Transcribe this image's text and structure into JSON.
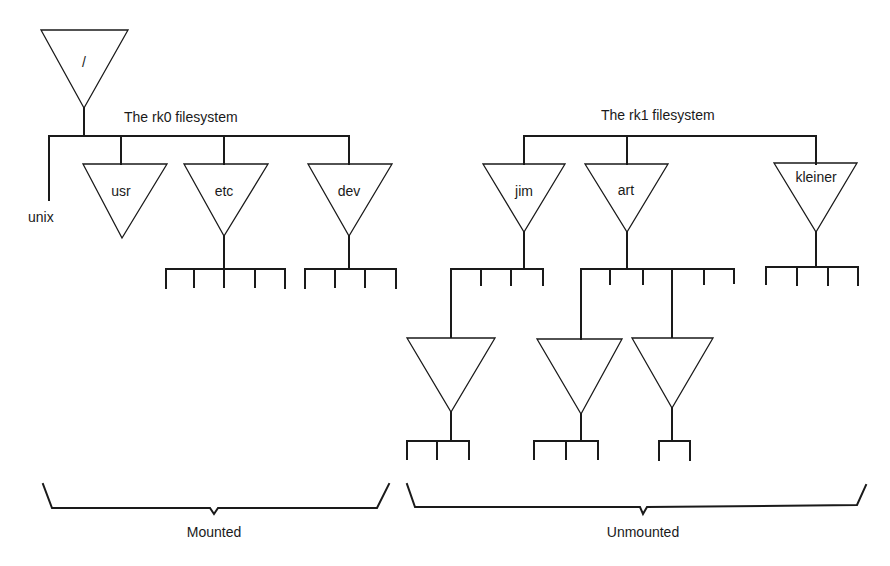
{
  "diagram": {
    "type": "filesystem-tree",
    "colors": {
      "ink": "#1a1a1a",
      "background": "#ffffff"
    },
    "root": {
      "label": "/"
    },
    "rk0": {
      "title": "The rk0 filesystem",
      "file": "unix",
      "dirs": [
        {
          "label": "usr",
          "children": 0
        },
        {
          "label": "etc",
          "children": 5
        },
        {
          "label": "dev",
          "children": 4
        }
      ]
    },
    "rk1": {
      "title": "The rk1 filesystem",
      "dirs": [
        {
          "label": "jim",
          "children": 4
        },
        {
          "label": "art",
          "children": 6
        },
        {
          "label": "kleiner",
          "children": 4
        }
      ],
      "subtrees": [
        {
          "parent": "jim",
          "label": "",
          "children": 3
        },
        {
          "parent": "art",
          "label": "",
          "children": 3
        },
        {
          "parent": "art",
          "label": "",
          "children": 2
        }
      ]
    },
    "groups": [
      {
        "label": "Mounted"
      },
      {
        "label": "Unmounted"
      }
    ]
  }
}
